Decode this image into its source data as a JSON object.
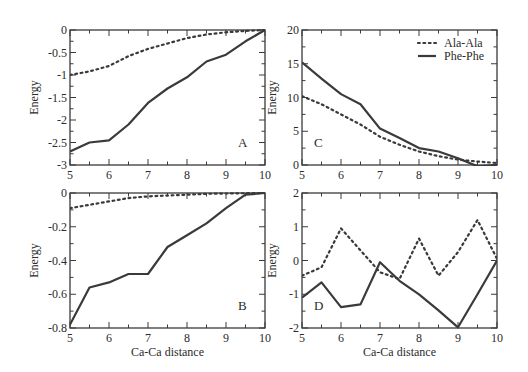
{
  "figure": {
    "x_axis_title": "Ca-Ca distance",
    "y_axis_title": "Energy",
    "line_color": "#3a3a3a",
    "legend": [
      {
        "label": "Ala-Ala",
        "style": "dotted"
      },
      {
        "label": "Phe-Phe",
        "style": "solid"
      }
    ]
  },
  "chart_data": [
    {
      "panel": "A",
      "type": "line",
      "title": "",
      "xlabel": "",
      "ylabel": "Energy",
      "xlim": [
        5,
        10
      ],
      "ylim": [
        -3,
        0
      ],
      "xticks": [
        5,
        6,
        7,
        8,
        9,
        10
      ],
      "yticks": [
        0,
        -0.5,
        -1,
        -1.5,
        -2,
        -2.5,
        -3
      ],
      "ytick_labels": [
        "0",
        "-0.5",
        "-1",
        "-1.5",
        "-2",
        "-2.5",
        "-3"
      ],
      "grid": false,
      "label_pos": "bottom-right",
      "x": [
        5,
        5.5,
        6,
        6.5,
        7,
        7.5,
        8,
        8.5,
        9,
        9.5,
        10
      ],
      "series": [
        {
          "name": "Ala-Ala",
          "style": "dotted",
          "values": [
            -1.0,
            -0.92,
            -0.8,
            -0.58,
            -0.42,
            -0.3,
            -0.18,
            -0.1,
            -0.05,
            -0.02,
            0.0
          ]
        },
        {
          "name": "Phe-Phe",
          "style": "solid",
          "values": [
            -2.7,
            -2.5,
            -2.45,
            -2.1,
            -1.62,
            -1.3,
            -1.05,
            -0.7,
            -0.55,
            -0.25,
            0.0
          ]
        }
      ]
    },
    {
      "panel": "C",
      "type": "line",
      "title": "",
      "xlabel": "",
      "ylabel": "Energy",
      "xlim": [
        5,
        10
      ],
      "ylim": [
        0,
        20
      ],
      "xticks": [
        5,
        6,
        7,
        8,
        9,
        10
      ],
      "yticks": [
        0,
        5,
        10,
        15,
        20
      ],
      "ytick_labels": [
        "0",
        "5",
        "10",
        "15",
        "20"
      ],
      "grid": false,
      "label_pos": "bottom-left",
      "legend_position": "top-right",
      "x": [
        5,
        5.5,
        6,
        6.5,
        7,
        7.5,
        8,
        8.5,
        9,
        9.5,
        10
      ],
      "series": [
        {
          "name": "Ala-Ala",
          "style": "dotted",
          "values": [
            10.2,
            9.0,
            7.5,
            6.0,
            4.2,
            3.0,
            2.0,
            1.3,
            0.8,
            0.5,
            0.3
          ]
        },
        {
          "name": "Phe-Phe",
          "style": "solid",
          "values": [
            15.2,
            12.8,
            10.5,
            9.0,
            5.4,
            4.0,
            2.5,
            2.0,
            1.0,
            -0.2,
            0.0
          ]
        }
      ]
    },
    {
      "panel": "B",
      "type": "line",
      "title": "",
      "xlabel": "Ca-Ca distance",
      "ylabel": "Energy",
      "xlim": [
        5,
        10
      ],
      "ylim": [
        -0.8,
        0
      ],
      "xticks": [
        5,
        6,
        7,
        8,
        9,
        10
      ],
      "yticks": [
        0,
        -0.2,
        -0.4,
        -0.6,
        -0.8
      ],
      "ytick_labels": [
        "0",
        "-0.2",
        "-0.4",
        "-0.6",
        "-0.8"
      ],
      "grid": false,
      "label_pos": "bottom-right",
      "x": [
        5,
        5.5,
        6,
        6.5,
        7,
        7.5,
        8,
        8.5,
        9,
        9.5,
        10
      ],
      "series": [
        {
          "name": "Ala-Ala",
          "style": "dotted",
          "values": [
            -0.09,
            -0.07,
            -0.05,
            -0.03,
            -0.02,
            -0.015,
            -0.01,
            -0.005,
            -0.003,
            -0.001,
            0.0
          ]
        },
        {
          "name": "Phe-Phe",
          "style": "solid",
          "values": [
            -0.78,
            -0.56,
            -0.53,
            -0.48,
            -0.48,
            -0.32,
            -0.25,
            -0.18,
            -0.09,
            -0.01,
            0.0
          ]
        }
      ]
    },
    {
      "panel": "D",
      "type": "line",
      "title": "",
      "xlabel": "Ca-Ca distance",
      "ylabel": "Energy",
      "xlim": [
        5,
        10
      ],
      "ylim": [
        -2,
        2
      ],
      "xticks": [
        5,
        6,
        7,
        8,
        9,
        10
      ],
      "yticks": [
        2,
        1,
        0,
        -1,
        -2
      ],
      "ytick_labels": [
        "2",
        "1",
        "0",
        "-1",
        "-2"
      ],
      "grid": false,
      "label_pos": "bottom-left",
      "x": [
        5,
        5.5,
        6,
        6.5,
        7,
        7.5,
        8,
        8.5,
        9,
        9.5,
        10
      ],
      "series": [
        {
          "name": "Ala-Ala",
          "style": "dotted",
          "values": [
            -0.45,
            -0.2,
            0.95,
            0.3,
            -0.35,
            -0.55,
            0.65,
            -0.45,
            0.25,
            1.2,
            0.05
          ]
        },
        {
          "name": "Phe-Phe",
          "style": "solid",
          "values": [
            -1.1,
            -0.65,
            -1.38,
            -1.3,
            -0.05,
            -0.6,
            -1.0,
            -1.48,
            -1.98,
            -1.0,
            0.0
          ]
        }
      ]
    }
  ]
}
